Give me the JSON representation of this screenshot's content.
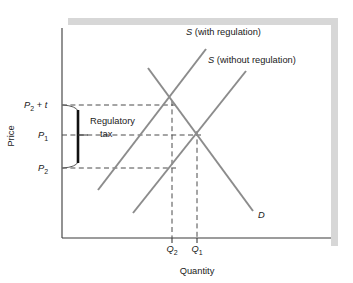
{
  "figure": {
    "name": "regulatory-tax-supply-demand-diagram",
    "background_color": "#ffffff",
    "shadow_color": "#d7d7d7",
    "axis_color": "#3a3a3a",
    "curve_color": "#8c8c8c",
    "dash_color": "#4a4a4a",
    "brace_color": "#111111",
    "text_color": "#1a1a1a"
  },
  "axes": {
    "y_axis_label": "Price",
    "x_axis_label": "Quantity",
    "y_axis_x": 62,
    "y_axis_top": 28,
    "y_axis_bottom": 238,
    "x_axis_y": 238,
    "x_axis_left": 62,
    "x_axis_right": 331
  },
  "price_ticks": [
    {
      "id": "p2-plus-t",
      "base": "P",
      "subscript": "2",
      "suffix": " + t",
      "suffix_italic_part": "t",
      "y": 105,
      "label_x": 24
    },
    {
      "id": "p1",
      "base": "P",
      "subscript": "1",
      "suffix": "",
      "y": 135,
      "label_x": 38
    },
    {
      "id": "p2",
      "base": "P",
      "subscript": "2",
      "suffix": "",
      "y": 168,
      "label_x": 38
    }
  ],
  "quantity_ticks": [
    {
      "id": "q2",
      "base": "Q",
      "subscript": "2",
      "x": 172,
      "label_y": 252
    },
    {
      "id": "q1",
      "base": "Q",
      "subscript": "1",
      "x": 197,
      "label_y": 252
    }
  ],
  "curves": [
    {
      "id": "supply-with-regulation",
      "label_base": "S",
      "label_rest": " (with regulation)",
      "label_x": 186,
      "label_y": 35,
      "x1": 98,
      "y1": 190,
      "x2": 206,
      "y2": 49
    },
    {
      "id": "supply-without-regulation",
      "label_base": "S",
      "label_rest": " (without regulation)",
      "label_x": 208,
      "label_y": 63,
      "x1": 133,
      "y1": 213,
      "x2": 246,
      "y2": 71
    },
    {
      "id": "demand",
      "label_base": "D",
      "label_rest": "",
      "label_x": 258,
      "label_y": 218,
      "x1": 148,
      "y1": 68,
      "x2": 253,
      "y2": 211
    }
  ],
  "annotations": {
    "regulatory_tax": {
      "line1": "Regulatory",
      "line2": "tax",
      "text_x": 90,
      "text_y1": 124,
      "text_y2": 137,
      "brace_top_y": 105,
      "brace_bottom_y": 168,
      "brace_bar_x": 78,
      "brace_anchor_x": 63,
      "leader_y": 135,
      "leader_x_end": 88
    }
  },
  "dashed_guides": [
    {
      "id": "p2-plus-t-guide",
      "x1": 62,
      "y1": 105,
      "x2": 176,
      "y2": 105
    },
    {
      "id": "p1-guide",
      "x1": 62,
      "y1": 135,
      "x2": 201,
      "y2": 135
    },
    {
      "id": "p2-guide",
      "x1": 62,
      "y1": 168,
      "x2": 176,
      "y2": 168
    },
    {
      "id": "q2-guide",
      "x1": 172,
      "y1": 101,
      "x2": 172,
      "y2": 238
    },
    {
      "id": "q1-guide",
      "x1": 197,
      "y1": 131,
      "x2": 197,
      "y2": 238
    }
  ],
  "intersections": [
    {
      "id": "regulated-equilibrium",
      "x": 172,
      "y": 101
    },
    {
      "id": "unregulated-equilibrium",
      "x": 197,
      "y": 135
    },
    {
      "id": "supplier-price-point",
      "x": 172,
      "y": 168
    }
  ]
}
